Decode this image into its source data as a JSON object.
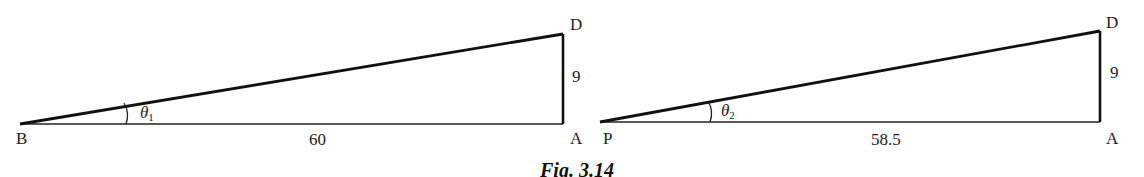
{
  "figure": {
    "caption": "Fig. 3.14",
    "stroke_color": "#111111",
    "background": "#ffffff"
  },
  "triangles": [
    {
      "id": "left",
      "vertices": {
        "left": "B",
        "right_bottom": "A",
        "right_top": "D"
      },
      "angle_label": "θ",
      "angle_subscript": "1",
      "base_length": "60",
      "height_length": "9"
    },
    {
      "id": "right",
      "vertices": {
        "left": "P",
        "right_bottom": "A",
        "right_top": "D"
      },
      "angle_label": "θ",
      "angle_subscript": "2",
      "base_length": "58.5",
      "height_length": "9"
    }
  ]
}
